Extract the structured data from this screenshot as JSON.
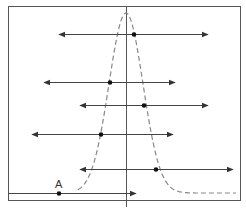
{
  "diagram": {
    "type": "normal-distribution-with-intervals",
    "colors": {
      "frame": "#555555",
      "axis": "#555555",
      "curve": "#888888",
      "line": "#444444",
      "dot": "#111111"
    },
    "frame": {
      "x": 8,
      "y": 6,
      "w": 232,
      "h": 194
    },
    "axis": {
      "x": 126,
      "y1": 6,
      "y2": 207
    },
    "curve": {
      "center_x": 126,
      "peak_y": 13,
      "baseline_y": 193,
      "sigma_px": 17,
      "left_x": 78,
      "right_x": 236
    },
    "lines": [
      {
        "y": 34,
        "x1": 59,
        "x2": 208,
        "dot_x": 134,
        "left_arrow": true,
        "right_arrow": true
      },
      {
        "y": 82,
        "x1": 44,
        "x2": 175,
        "dot_x": 110,
        "left_arrow": true,
        "right_arrow": true
      },
      {
        "y": 105,
        "x1": 80,
        "x2": 208,
        "dot_x": 144,
        "left_arrow": true,
        "right_arrow": true
      },
      {
        "y": 134,
        "x1": 32,
        "x2": 173,
        "dot_x": 101,
        "left_arrow": true,
        "right_arrow": true
      },
      {
        "y": 169,
        "x1": 80,
        "x2": 233,
        "dot_x": 156,
        "left_arrow": true,
        "right_arrow": true
      },
      {
        "y": 193,
        "x1": 8,
        "x2": 136,
        "dot_x": 59,
        "left_arrow": false,
        "right_arrow": true,
        "label": "A"
      }
    ],
    "point_label": "A"
  }
}
